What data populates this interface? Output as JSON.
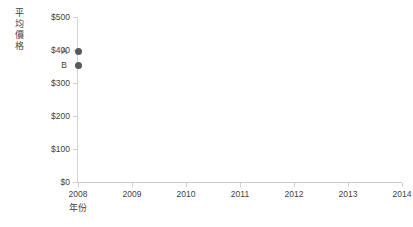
{
  "chart_data": {
    "type": "scatter",
    "title": "",
    "xlabel": "年份",
    "ylabel": "平均價格",
    "xlim": [
      2008,
      2014
    ],
    "ylim": [
      0,
      500
    ],
    "grid": false,
    "legend": "none",
    "x_ticks": [
      "2008",
      "2009",
      "2010",
      "2011",
      "2012",
      "2013",
      "2014"
    ],
    "y_ticks": [
      "$0",
      "$100",
      "$200",
      "$300",
      "$400",
      "$500"
    ],
    "y_tick_values": [
      0,
      100,
      200,
      300,
      400,
      500
    ],
    "point_color": "#595959",
    "axis_color": "#d0d0d0",
    "text_color": "#3f3f3f",
    "points": [
      {
        "label": "A",
        "x": 2008,
        "y": 395
      },
      {
        "label": "B",
        "x": 2008,
        "y": 352
      }
    ]
  }
}
